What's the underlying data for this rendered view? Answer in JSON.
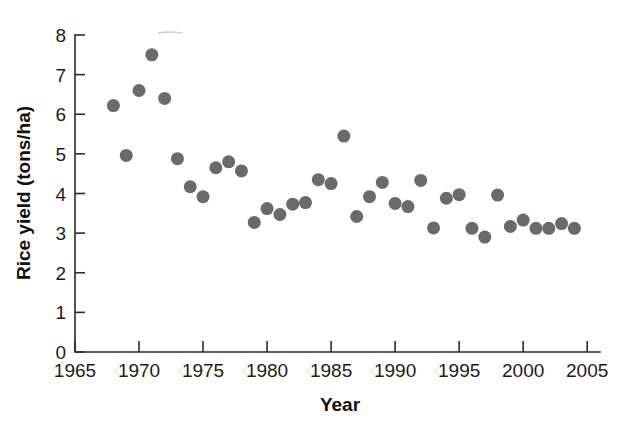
{
  "chart_data": {
    "type": "scatter",
    "title": "",
    "subtitle": "",
    "xlabel": "Year",
    "ylabel": "Rice yield (tons/ha)",
    "xlim": [
      1965,
      2006
    ],
    "ylim": [
      0,
      8
    ],
    "xticks": [
      1965,
      1970,
      1975,
      1980,
      1985,
      1990,
      1995,
      2000,
      2005
    ],
    "xtick_labels": [
      "1965",
      "1970",
      "1975",
      "1980",
      "1985",
      "1990",
      "1995",
      "2000",
      "2005"
    ],
    "yticks": [
      0,
      1,
      2,
      3,
      4,
      5,
      6,
      7,
      8
    ],
    "ytick_labels": [
      "0",
      "1",
      "2",
      "3",
      "4",
      "5",
      "6",
      "7",
      "8"
    ],
    "grid": false,
    "legend": null,
    "legend_position": "none",
    "marker": {
      "shape": "circle",
      "color": "#6a6a6a",
      "radius_px": 6.5
    },
    "series": [
      {
        "name": "Rice yield",
        "color": "#6a6a6a",
        "x": [
          1968,
          1969,
          1970,
          1971,
          1972,
          1973,
          1974,
          1975,
          1976,
          1977,
          1978,
          1979,
          1980,
          1981,
          1982,
          1983,
          1984,
          1985,
          1986,
          1987,
          1988,
          1989,
          1990,
          1991,
          1992,
          1993,
          1994,
          1995,
          1996,
          1997,
          1998,
          1999,
          2000,
          2001,
          2002,
          2003,
          2004
        ],
        "y": [
          6.22,
          4.96,
          6.6,
          7.5,
          6.4,
          4.88,
          4.17,
          3.92,
          4.65,
          4.8,
          4.57,
          3.27,
          3.62,
          3.47,
          3.73,
          3.77,
          4.35,
          4.25,
          5.45,
          3.42,
          3.92,
          4.28,
          3.75,
          3.67,
          4.33,
          3.13,
          3.88,
          3.97,
          3.12,
          2.9,
          3.96,
          3.17,
          3.33,
          3.12,
          3.12,
          3.24,
          3.12
        ]
      }
    ],
    "points": [
      {
        "year": 1968,
        "yield": 6.22
      },
      {
        "year": 1969,
        "yield": 4.96
      },
      {
        "year": 1970,
        "yield": 6.6
      },
      {
        "year": 1971,
        "yield": 7.5
      },
      {
        "year": 1972,
        "yield": 6.4
      },
      {
        "year": 1973,
        "yield": 4.88
      },
      {
        "year": 1974,
        "yield": 4.17
      },
      {
        "year": 1975,
        "yield": 3.92
      },
      {
        "year": 1976,
        "yield": 4.65
      },
      {
        "year": 1977,
        "yield": 4.8
      },
      {
        "year": 1978,
        "yield": 4.57
      },
      {
        "year": 1979,
        "yield": 3.27
      },
      {
        "year": 1980,
        "yield": 3.62
      },
      {
        "year": 1981,
        "yield": 3.47
      },
      {
        "year": 1982,
        "yield": 3.73
      },
      {
        "year": 1983,
        "yield": 3.77
      },
      {
        "year": 1984,
        "yield": 4.35
      },
      {
        "year": 1985,
        "yield": 4.25
      },
      {
        "year": 1986,
        "yield": 5.45
      },
      {
        "year": 1987,
        "yield": 3.42
      },
      {
        "year": 1988,
        "yield": 3.92
      },
      {
        "year": 1989,
        "yield": 4.28
      },
      {
        "year": 1990,
        "yield": 3.75
      },
      {
        "year": 1991,
        "yield": 3.67
      },
      {
        "year": 1992,
        "yield": 4.33
      },
      {
        "year": 1993,
        "yield": 3.13
      },
      {
        "year": 1994,
        "yield": 3.88
      },
      {
        "year": 1995,
        "yield": 3.97
      },
      {
        "year": 1996,
        "yield": 3.12
      },
      {
        "year": 1997,
        "yield": 2.9
      },
      {
        "year": 1998,
        "yield": 3.96
      },
      {
        "year": 1999,
        "yield": 3.17
      },
      {
        "year": 2000,
        "yield": 3.33
      },
      {
        "year": 2001,
        "yield": 3.12
      },
      {
        "year": 2002,
        "yield": 3.12
      },
      {
        "year": 2003,
        "yield": 3.24
      },
      {
        "year": 2004,
        "yield": 3.12
      }
    ],
    "annotations": []
  },
  "geometry": {
    "plot_left": 75,
    "plot_right": 600,
    "plot_bottom": 352,
    "plot_top": 35,
    "x_tick_spacing_px": 12.8,
    "y_unit_px": 39.6
  }
}
